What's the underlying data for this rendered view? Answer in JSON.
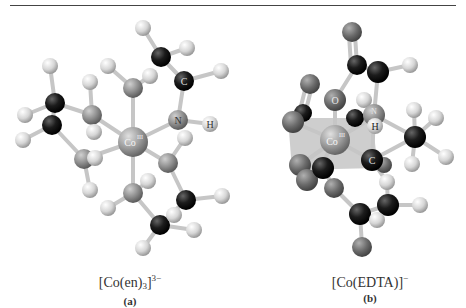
{
  "figure": {
    "panels": [
      {
        "id": "a",
        "formula_main": "[Co(en)",
        "formula_sub": "3",
        "formula_close": "]",
        "formula_charge": "3−",
        "sublabel": "(a)",
        "atom_labels": {
          "center": "Co",
          "nitrogen": "N",
          "hydrogen": "H",
          "carbon": "C"
        }
      },
      {
        "id": "b",
        "formula_main": "[Co(EDTA)]",
        "formula_charge": "−",
        "sublabel": "(b)",
        "atom_labels": {
          "center": "Co",
          "oxygen": "O",
          "nitrogen": "N",
          "hydrogen": "H",
          "carbon": "C"
        }
      }
    ],
    "colors": {
      "carbon": "#1a1a1a",
      "hydrogen": "#d8d8d8",
      "nitrogen": "#8a8a8a",
      "oxygen": "#6e6e6e",
      "cobalt": "#9a9a9a",
      "bond": "#c8c8c8",
      "octahedron": "#b8b8b8",
      "rule": "#444444"
    }
  }
}
